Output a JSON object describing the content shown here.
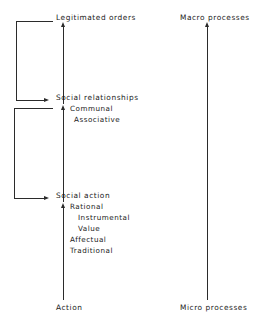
{
  "diagram": {
    "title_text": "",
    "line_color": "#2b2b2b",
    "text_color": "#1a1a1a",
    "background_color": "#ffffff",
    "left_column": {
      "top_node": "Legitimated orders",
      "middle_node": "Social relationships",
      "middle_sub_items": [
        "Communal",
        "Associative"
      ],
      "lower_node": "Social action",
      "lower_sub_items": [
        "Rational",
        "Instrumental",
        "Value",
        "Affectual",
        "Traditional"
      ],
      "bottom_node": "Action"
    },
    "right_column": {
      "top_node": "Macro processes",
      "bottom_node": "Micro processes"
    }
  }
}
